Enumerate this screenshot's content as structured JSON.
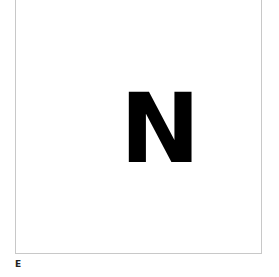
{
  "card": {
    "letter": "N"
  },
  "caption": "E"
}
